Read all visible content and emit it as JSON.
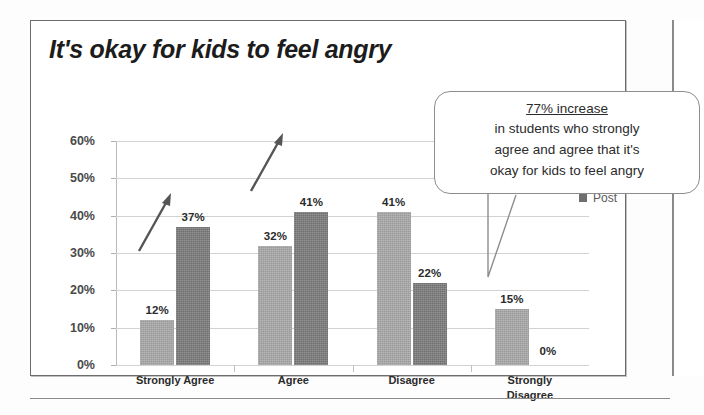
{
  "slide": {
    "title": "It's okay for kids to feel angry"
  },
  "callout": {
    "heading": "77% increase",
    "lines": [
      "in students who strongly",
      "agree and agree that it's",
      "okay for kids to feel angry"
    ]
  },
  "legend": {
    "position": "right",
    "items": [
      {
        "label": "Pre",
        "color": "#9a9a9a"
      },
      {
        "label": "Post",
        "color": "#6f6f6f"
      }
    ]
  },
  "chart_data": {
    "type": "bar",
    "title": "It's okay for kids to feel angry",
    "xlabel": "",
    "ylabel": "",
    "ylim": [
      0,
      60
    ],
    "ytick_labels": [
      "0%",
      "10%",
      "20%",
      "30%",
      "40%",
      "50%",
      "60%"
    ],
    "ytick_values": [
      0,
      10,
      20,
      30,
      40,
      50,
      60
    ],
    "grid": true,
    "categories": [
      "Strongly Agree",
      "Agree",
      "Disagree",
      "Strongly Disagree"
    ],
    "category_label_lines": [
      [
        "Strongly Agree"
      ],
      [
        "Agree"
      ],
      [
        "Disagree"
      ],
      [
        "Strongly",
        "Disagree"
      ]
    ],
    "series": [
      {
        "name": "Pre",
        "color": "#9a9a9a",
        "values": [
          12,
          32,
          41,
          15
        ],
        "data_labels": [
          "12%",
          "32%",
          "41%",
          "15%"
        ]
      },
      {
        "name": "Post",
        "color": "#6f6f6f",
        "values": [
          37,
          41,
          22,
          0
        ],
        "data_labels": [
          "37%",
          "41%",
          "22%",
          "0%"
        ]
      }
    ],
    "annotations": [
      {
        "kind": "arrow",
        "note": "upward arrow over Strongly Agree group"
      },
      {
        "kind": "arrow",
        "note": "upward arrow over Agree group"
      },
      {
        "kind": "callout",
        "text": "77% increase in students who strongly agree and agree that it's okay for kids to feel angry"
      }
    ]
  }
}
